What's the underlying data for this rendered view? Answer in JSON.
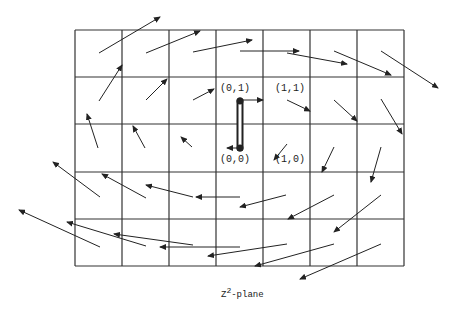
{
  "figure": {
    "caption_base": "Z",
    "caption_exp": "2",
    "caption_rest": "-plane",
    "point_labels": [
      {
        "text": "(0,1)",
        "x": 220,
        "y": 83
      },
      {
        "text": "(1,1)",
        "x": 275,
        "y": 83
      },
      {
        "text": "(0,0)",
        "x": 220,
        "y": 154
      },
      {
        "text": "(1,0)",
        "x": 275,
        "y": 154
      }
    ],
    "colors": {
      "line": "#222222",
      "background": "#ffffff"
    }
  },
  "chart_data": {
    "type": "vector-field-diagram",
    "grid": {
      "x_lines": [
        75,
        122,
        169,
        216,
        263,
        310,
        357,
        404
      ],
      "y_lines": [
        30,
        77,
        124,
        172,
        219,
        266
      ],
      "columns": 7,
      "rows": 5
    },
    "path": {
      "from_label": "(0,0)",
      "to_label": "(0,1)",
      "from": [
        240,
        148
      ],
      "to": [
        240,
        101
      ]
    },
    "arrows": [
      [
        99,
        53,
        160,
        17
      ],
      [
        146,
        53,
        200,
        31
      ],
      [
        193,
        52,
        252,
        40
      ],
      [
        240,
        51,
        299,
        51
      ],
      [
        287,
        53,
        347,
        64
      ],
      [
        334,
        51,
        391,
        75
      ],
      [
        381,
        51,
        438,
        88
      ],
      [
        99,
        101,
        122,
        65
      ],
      [
        146,
        100,
        167,
        79
      ],
      [
        193,
        100,
        214,
        89
      ],
      [
        240,
        100,
        263,
        100
      ],
      [
        287,
        100,
        310,
        111
      ],
      [
        334,
        100,
        357,
        121
      ],
      [
        381,
        99,
        402,
        134
      ],
      [
        98,
        148,
        87,
        114
      ],
      [
        145,
        148,
        133,
        126
      ],
      [
        192,
        147,
        181,
        137
      ],
      [
        240,
        148,
        227,
        148
      ],
      [
        287,
        144,
        274,
        160
      ],
      [
        334,
        147,
        322,
        172
      ],
      [
        381,
        147,
        371,
        182
      ],
      [
        100,
        197,
        53,
        162
      ],
      [
        146,
        198,
        102,
        174
      ],
      [
        193,
        197,
        146,
        185
      ],
      [
        240,
        197,
        196,
        197
      ],
      [
        286,
        195,
        240,
        207
      ],
      [
        334,
        195,
        288,
        219
      ],
      [
        381,
        195,
        334,
        232
      ],
      [
        100,
        247,
        19,
        210
      ],
      [
        146,
        246,
        67,
        222
      ],
      [
        193,
        245,
        114,
        234
      ],
      [
        240,
        247,
        160,
        247
      ],
      [
        287,
        244,
        208,
        256
      ],
      [
        334,
        244,
        255,
        266
      ],
      [
        381,
        244,
        300,
        279
      ]
    ]
  }
}
